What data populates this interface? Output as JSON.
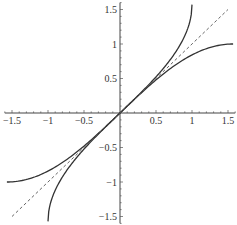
{
  "chart_data": {
    "type": "line",
    "title": "",
    "xlabel": "",
    "ylabel": "",
    "xlim": [
      -1.6,
      1.6
    ],
    "ylim": [
      -1.6,
      1.6
    ],
    "grid": false,
    "legend": null,
    "x_ticks": [
      -1.5,
      -1,
      -0.5,
      0.5,
      1,
      1.5
    ],
    "x_tick_labels": [
      "-1.5",
      "-1",
      "-0.5",
      "0.5",
      "1",
      "1.5"
    ],
    "y_ticks": [
      -1.5,
      -1,
      -0.5,
      0.5,
      1,
      1.5
    ],
    "y_tick_labels": [
      "-1.5",
      "-1",
      "-0.5",
      "0.5",
      "1",
      "1.5"
    ],
    "series": [
      {
        "name": "sin(x)",
        "style": "solid",
        "color": "#333333",
        "x": [
          -1.5708,
          -1.25,
          -1,
          -0.75,
          -0.5,
          -0.25,
          0,
          0.25,
          0.5,
          0.75,
          1,
          1.25,
          1.5708
        ],
        "y": [
          -1,
          -0.949,
          -0.841,
          -0.682,
          -0.479,
          -0.247,
          0,
          0.247,
          0.479,
          0.682,
          0.841,
          0.949,
          1
        ]
      },
      {
        "name": "arcsin(x)",
        "style": "solid",
        "color": "#333333",
        "x": [
          -1,
          -0.95,
          -0.9,
          -0.75,
          -0.5,
          -0.25,
          0,
          0.25,
          0.5,
          0.75,
          0.9,
          0.95,
          1
        ],
        "y": [
          -1.5708,
          -1.253,
          -1.12,
          -0.848,
          -0.524,
          -0.253,
          0,
          0.253,
          0.524,
          0.848,
          1.12,
          1.253,
          1.5708
        ]
      },
      {
        "name": "y = x",
        "style": "dashed",
        "color": "#555555",
        "x": [
          -1.5,
          1.5
        ],
        "y": [
          -1.5,
          1.5
        ]
      }
    ]
  },
  "layout": {
    "origin_px": [
      120,
      113
    ],
    "scale_x": 72,
    "scale_y": 69
  }
}
